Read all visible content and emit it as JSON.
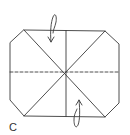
{
  "diagram": {
    "type": "origami-fold-diagram",
    "step_label": "C",
    "colors": {
      "stroke": "#3a3a3a",
      "background": "#ffffff"
    },
    "shape": "octagon (rectangle with cut corners)",
    "lines": {
      "solid_creases": [
        "diagonal top-left to bottom-right",
        "diagonal top-right to bottom-left",
        "vertical center"
      ],
      "dashed_crease": "horizontal center (valley fold)"
    },
    "arrows": [
      {
        "name": "top-fold-arrow",
        "direction": "down",
        "position": "top center-left"
      },
      {
        "name": "bottom-fold-arrow",
        "direction": "up",
        "position": "bottom center-right"
      }
    ]
  }
}
